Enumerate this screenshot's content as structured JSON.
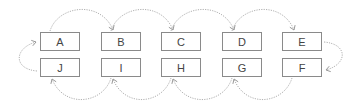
{
  "diagram": {
    "type": "cycle",
    "top_row": [
      "A",
      "B",
      "C",
      "D",
      "E"
    ],
    "bottom_row": [
      "J",
      "I",
      "H",
      "G",
      "F"
    ],
    "nodes": [
      {
        "id": "A",
        "label": "A"
      },
      {
        "id": "B",
        "label": "B"
      },
      {
        "id": "C",
        "label": "C"
      },
      {
        "id": "D",
        "label": "D"
      },
      {
        "id": "E",
        "label": "E"
      },
      {
        "id": "F",
        "label": "F"
      },
      {
        "id": "G",
        "label": "G"
      },
      {
        "id": "H",
        "label": "H"
      },
      {
        "id": "I",
        "label": "I"
      },
      {
        "id": "J",
        "label": "J"
      }
    ],
    "edges": [
      {
        "from": "A",
        "to": "B"
      },
      {
        "from": "B",
        "to": "C"
      },
      {
        "from": "C",
        "to": "D"
      },
      {
        "from": "D",
        "to": "E"
      },
      {
        "from": "E",
        "to": "F"
      },
      {
        "from": "F",
        "to": "G"
      },
      {
        "from": "G",
        "to": "H"
      },
      {
        "from": "H",
        "to": "I"
      },
      {
        "from": "I",
        "to": "J"
      },
      {
        "from": "J",
        "to": "A"
      }
    ],
    "edge_style": "dotted",
    "colors": {
      "border": "#8a8a8a",
      "text": "#444444",
      "edge": "#b0b0b0"
    }
  }
}
